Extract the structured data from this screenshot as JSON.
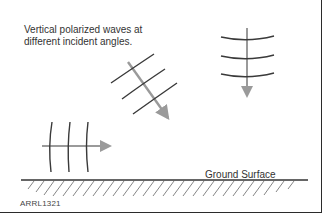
{
  "diagram": {
    "caption_line1": "Vertical polarized waves at",
    "caption_line2": "different incident angles.",
    "ground_label": "Ground Surface",
    "figure_id": "ARRL1321",
    "colors": {
      "wavefront": "#3a3a3a",
      "propagation_arrow": "#9a9a9a",
      "ground": "#333333",
      "hatch": "#777777",
      "frame": "#2b2b2b"
    },
    "waves": [
      {
        "name": "vertical-down",
        "direction": "downward",
        "wavefronts": 3
      },
      {
        "name": "oblique",
        "direction": "down-right diagonal",
        "wavefronts": 3
      },
      {
        "name": "horizontal-grazing",
        "direction": "rightward",
        "wavefronts": 3
      }
    ]
  }
}
